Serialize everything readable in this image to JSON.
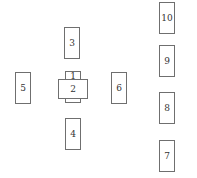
{
  "diagram": {
    "type": "card-spread-layout",
    "cards": [
      {
        "position": "1",
        "orientation": "vertical"
      },
      {
        "position": "2",
        "orientation": "horizontal"
      },
      {
        "position": "3",
        "orientation": "vertical"
      },
      {
        "position": "4",
        "orientation": "vertical"
      },
      {
        "position": "5",
        "orientation": "vertical"
      },
      {
        "position": "6",
        "orientation": "vertical"
      },
      {
        "position": "7",
        "orientation": "vertical"
      },
      {
        "position": "8",
        "orientation": "vertical"
      },
      {
        "position": "9",
        "orientation": "vertical"
      },
      {
        "position": "10",
        "orientation": "vertical"
      }
    ]
  }
}
